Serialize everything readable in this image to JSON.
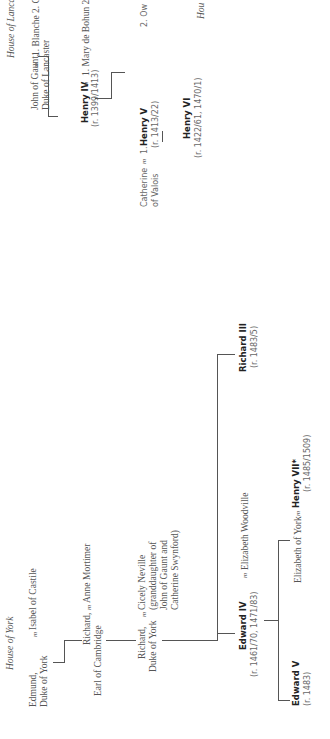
{
  "lancaster": {
    "house_label": "House of Lancaster",
    "john_line1": "John of Gaunt,",
    "john_line2": "Duke of Lancaster",
    "m": "m",
    "wives": "1. Blanche   2. Catherine Swynford",
    "henry4_name": "Henry IV",
    "henry4_reign": "(r. 1399/1413)",
    "henry4_wives": "1. Mary de Bohun   2. Joan of Navarre",
    "catherine_line1": "Catherine",
    "catherine_line2": "of Valois",
    "henry5_prefix": "1.",
    "henry5_name": "Henry V",
    "henry5_reign": "(r. 1413/22)",
    "henry6_name": "Henry VI",
    "henry6_reign": "(r. 1422/61, 1470/1)",
    "owen_partial": "2. Ow",
    "house_partial": "Hou"
  },
  "york": {
    "house_label": "House of York",
    "edmund_line1": "Edmund,",
    "edmund_line2": "Duke of York",
    "m": "m",
    "edmund_wife": "Isabel of Castile",
    "richard_cam_line1": "Richard,",
    "richard_cam_line2": "Earl of Cambridge",
    "richard_cam_wife": "Anne Mortimer",
    "richard_york_line1": "Richard,",
    "richard_york_line2": "Duke of York",
    "cicely_line1": "Cicely Neville",
    "cicely_line2": "(granddaughter of",
    "cicely_line3": "John of Gaunt and",
    "cicely_line4": "Catherine Swynford)",
    "edward4_name": "Edward IV",
    "edward4_reign": "(r. 1461/70, 1471/83)",
    "edward4_wife": "Elizabeth Woodville",
    "richard3_name": "Richard III",
    "richard3_reign": "(r. 1483/5)",
    "edward5_name": "Edward V",
    "edward5_reign": "(r. 1483)",
    "elizabeth_york": "Elizabeth of York",
    "henry7_name": "Henry VII*",
    "henry7_reign": "(r. 1485/1509)"
  }
}
